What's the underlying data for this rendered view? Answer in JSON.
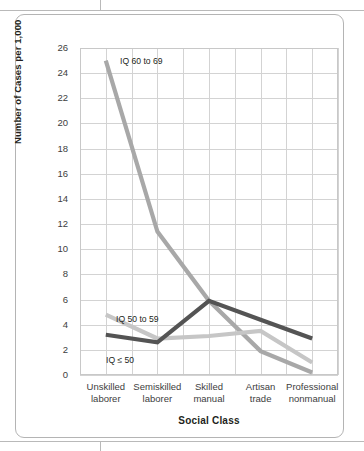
{
  "figure": {
    "y_axis_title": "Number of Cases per 1,000",
    "x_axis_title": "Social Class"
  },
  "chart_data": {
    "type": "line",
    "title": "",
    "xlabel": "Social Class",
    "ylabel": "Number of Cases per 1,000",
    "categories": [
      "Unskilled laborer",
      "Semiskilled laborer",
      "Skilled manual",
      "Artisan trade",
      "Professional nonmanual"
    ],
    "category_lines": [
      [
        "Unskilled",
        "laborer"
      ],
      [
        "Semiskilled",
        "laborer"
      ],
      [
        "Skilled",
        "manual"
      ],
      [
        "Artisan",
        "trade"
      ],
      [
        "Professional",
        "nonmanual"
      ]
    ],
    "ylim": [
      0,
      26
    ],
    "yticks": [
      0,
      2,
      4,
      6,
      8,
      10,
      12,
      14,
      16,
      18,
      20,
      22,
      24,
      26
    ],
    "grid": true,
    "legend": "inline-labels",
    "series": [
      {
        "name": "IQ 60 to 69",
        "color": "#a8a8a8",
        "values": [
          25.0,
          11.4,
          5.9,
          1.9,
          0.2
        ]
      },
      {
        "name": "IQ 50 to 59",
        "color": "#c6c6c6",
        "values": [
          4.8,
          2.9,
          3.1,
          3.5,
          1.0
        ]
      },
      {
        "name": "IQ ≤ 50",
        "color": "#545454",
        "values": [
          3.2,
          2.6,
          5.9,
          4.4,
          2.9
        ]
      }
    ],
    "annotations": [
      {
        "text": "IQ 60 to 69",
        "series": "IQ 60 to 69"
      },
      {
        "text": "IQ 50 to 59",
        "series": "IQ 50 to 59"
      },
      {
        "text": "IQ ≤ 50",
        "series": "IQ ≤ 50"
      }
    ]
  }
}
